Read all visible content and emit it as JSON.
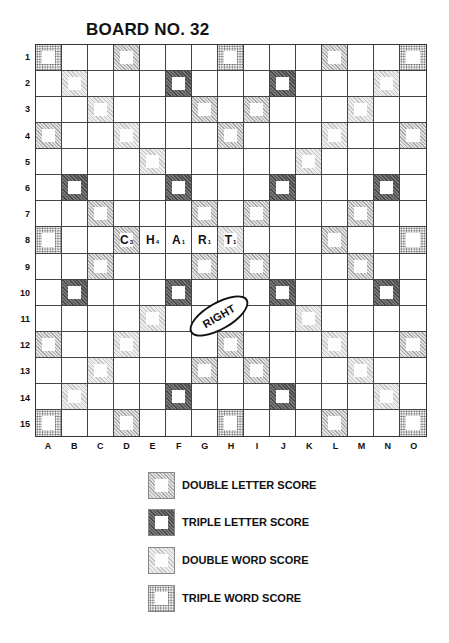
{
  "title": "BOARD NO. 32",
  "board": {
    "columns": [
      "A",
      "B",
      "C",
      "D",
      "E",
      "F",
      "G",
      "H",
      "I",
      "J",
      "K",
      "L",
      "M",
      "N",
      "O"
    ],
    "rows": [
      "1",
      "2",
      "3",
      "4",
      "5",
      "6",
      "7",
      "8",
      "9",
      "10",
      "11",
      "12",
      "13",
      "14",
      "15"
    ],
    "premium_squares": {
      "TW": [
        "A1",
        "H1",
        "O1",
        "A8",
        "O8",
        "A15",
        "H15",
        "O15"
      ],
      "DW": [
        "B2",
        "C3",
        "D4",
        "E5",
        "N2",
        "M3",
        "L4",
        "K5",
        "B14",
        "C13",
        "D12",
        "E11",
        "N14",
        "M13",
        "L12",
        "K11",
        "H8"
      ],
      "TL": [
        "F2",
        "J2",
        "B6",
        "F6",
        "J6",
        "N6",
        "B10",
        "F10",
        "J10",
        "N10",
        "F14",
        "J14"
      ],
      "DL": [
        "D1",
        "L1",
        "G3",
        "I3",
        "A4",
        "H4",
        "O4",
        "C7",
        "G7",
        "I7",
        "M7",
        "D8",
        "L8",
        "C9",
        "G9",
        "I9",
        "M9",
        "A12",
        "H12",
        "O12",
        "G13",
        "I13",
        "D15",
        "L15"
      ]
    },
    "tiles": [
      {
        "cell": "D8",
        "letter": "C",
        "value": "3"
      },
      {
        "cell": "E8",
        "letter": "H",
        "value": "4"
      },
      {
        "cell": "F8",
        "letter": "A",
        "value": "1"
      },
      {
        "cell": "G8",
        "letter": "R",
        "value": "1"
      },
      {
        "cell": "H8",
        "letter": "T",
        "value": "1"
      }
    ],
    "annotation": {
      "text": "RIGHT"
    }
  },
  "legend": [
    {
      "type": "DL",
      "label": "DOUBLE LETTER SCORE"
    },
    {
      "type": "TL",
      "label": "TRIPLE LETTER SCORE"
    },
    {
      "type": "DW",
      "label": "DOUBLE WORD SCORE"
    },
    {
      "type": "TW",
      "label": "TRIPLE WORD SCORE"
    }
  ]
}
